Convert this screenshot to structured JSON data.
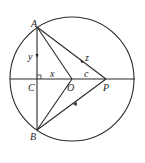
{
  "diagram": {
    "type": "geometry",
    "points": {
      "A": {
        "label": "A",
        "x": 37,
        "y": 27
      },
      "B": {
        "label": "B",
        "x": 37,
        "y": 130
      },
      "C": {
        "label": "C",
        "x": 37,
        "y": 79
      },
      "O": {
        "label": "O",
        "x": 72,
        "y": 79
      },
      "P": {
        "label": "P",
        "x": 106,
        "y": 79
      }
    },
    "circle": {
      "center": "O",
      "cx": 72,
      "cy": 79,
      "r": 62
    },
    "segment_labels": {
      "AC": "y",
      "CO": "x",
      "OP": "c",
      "AP": "z"
    },
    "right_angle_at": "C",
    "colors": {
      "stroke": "#2a2a2a",
      "text": "#222222",
      "background": "#ffffff"
    }
  }
}
